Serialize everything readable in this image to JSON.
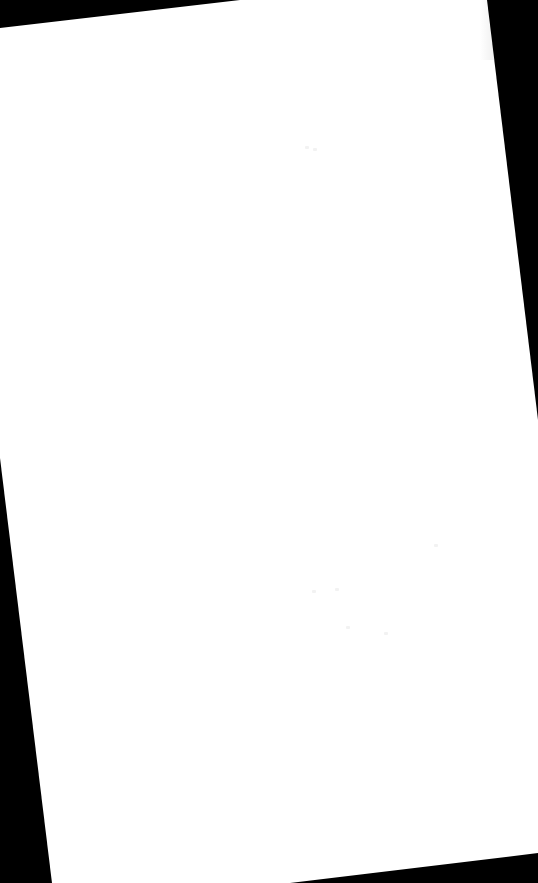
{
  "document": {
    "background_color": "#000000",
    "page_color": "#ffffff",
    "content": "",
    "specks": [
      {
        "x": 305,
        "y": 146
      },
      {
        "x": 313,
        "y": 148
      },
      {
        "x": 312,
        "y": 590
      },
      {
        "x": 335,
        "y": 588
      },
      {
        "x": 346,
        "y": 626
      },
      {
        "x": 384,
        "y": 632
      },
      {
        "x": 434,
        "y": 544
      }
    ]
  }
}
